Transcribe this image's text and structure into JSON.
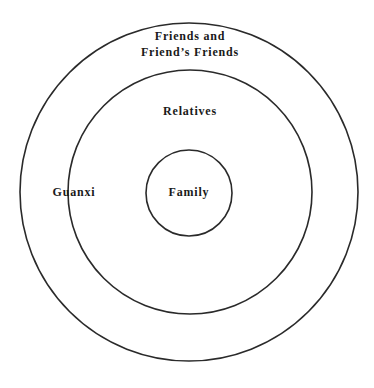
{
  "diagram": {
    "type": "concentric-circles",
    "stroke_color": "#2a2a2a",
    "background": "#ffffff",
    "circles": [
      {
        "name": "outer",
        "cx": 189,
        "cy": 192,
        "r": 169
      },
      {
        "name": "middle",
        "cx": 190,
        "cy": 192,
        "r": 122
      },
      {
        "name": "inner",
        "cx": 189,
        "cy": 193,
        "r": 43
      }
    ],
    "labels": {
      "outer_line1": "Friends and",
      "outer_line2": "Friend’s Friends",
      "middle": "Relatives",
      "inner": "Family",
      "ring": "Guanxi"
    }
  }
}
